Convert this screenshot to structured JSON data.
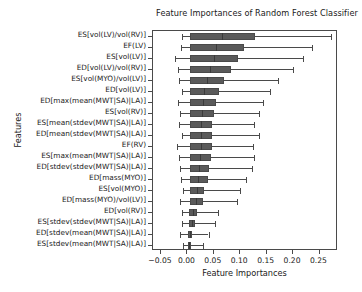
{
  "chart_data": {
    "type": "boxplot",
    "title": "Feature Importances of Random Forest Classifier",
    "xlabel": "Feature Importances",
    "ylabel": "Features",
    "orientation": "horizontal",
    "xlim": [
      -0.065,
      0.285
    ],
    "grid": false,
    "legend": null,
    "xticks": [
      -0.05,
      0.0,
      0.05,
      0.1,
      0.15,
      0.2,
      0.25
    ],
    "xticklabels": [
      "−0.05",
      "0.00",
      "0.05",
      "0.10",
      "0.15",
      "0.20",
      "0.25"
    ],
    "categories": [
      "ES[vol(LV)/vol(RV)]",
      "EF(LV)",
      "ES[vol(LV)]",
      "ED[vol(LV)/vol(RV)]",
      "ES[vol(MYO)/vol(LV)]",
      "ED[vol(LV)]",
      "ED[max(mean(MWT|SA)|LA)]",
      "ES[vol(RV)]",
      "ES[mean(stdev(MWT|SA)|LA)]",
      "ED[mean(stdev(MWT|SA)|LA)]",
      "EF(RV)",
      "ES[max(mean(MWT|SA)|LA)]",
      "ED[stdev(stdev(MWT|SA)|LA)]",
      "ED[mass(MYO)]",
      "ES[vol(MYO)]",
      "ED[mass(MYO)/vol(LV)]",
      "ED[vol(RV)]",
      "ES[stdev(stdev(MWT|SA)|LA)]",
      "ED[stdev(mean(MWT|SA)|LA)]",
      "ES[stdev(mean(MWT|SA)|LA)]"
    ],
    "boxes": [
      {
        "label": "ES[vol(LV)/vol(RV)]",
        "whislo": -0.011,
        "q1": 0.0045,
        "med": 0.065,
        "q3": 0.128,
        "whishi": 0.272
      },
      {
        "label": "EF(LV)",
        "whislo": -0.012,
        "q1": 0.0045,
        "med": 0.055,
        "q3": 0.107,
        "whishi": 0.236
      },
      {
        "label": "ES[vol(LV)]",
        "whislo": -0.024,
        "q1": 0.0045,
        "med": 0.05,
        "q3": 0.096,
        "whishi": 0.218
      },
      {
        "label": "ED[vol(LV)/vol(RV)]",
        "whislo": -0.018,
        "q1": 0.0045,
        "med": 0.043,
        "q3": 0.082,
        "whishi": 0.199
      },
      {
        "label": "ES[vol(MYO)/vol(LV)]",
        "whislo": -0.015,
        "q1": 0.0045,
        "med": 0.037,
        "q3": 0.07,
        "whishi": 0.172
      },
      {
        "label": "ED[vol(LV)]",
        "whislo": -0.01,
        "q1": 0.0045,
        "med": 0.032,
        "q3": 0.06,
        "whishi": 0.157
      },
      {
        "label": "ED[max(mean(MWT|SA)|LA)]",
        "whislo": -0.017,
        "q1": 0.0045,
        "med": 0.029,
        "q3": 0.054,
        "whishi": 0.144
      },
      {
        "label": "ES[vol(RV)]",
        "whislo": -0.013,
        "q1": 0.0045,
        "med": 0.027,
        "q3": 0.051,
        "whishi": 0.136
      },
      {
        "label": "ES[mean(stdev(MWT|SA)|LA)]",
        "whislo": -0.016,
        "q1": 0.0045,
        "med": 0.025,
        "q3": 0.047,
        "whishi": 0.126
      },
      {
        "label": "ED[mean(stdev(MWT|SA)|LA)]",
        "whislo": -0.011,
        "q1": 0.0045,
        "med": 0.025,
        "q3": 0.047,
        "whishi": 0.135
      },
      {
        "label": "EF(RV)",
        "whislo": -0.02,
        "q1": 0.0045,
        "med": 0.025,
        "q3": 0.046,
        "whishi": 0.125
      },
      {
        "label": "ES[max(mean(MWT|SA)|LA)]",
        "whislo": -0.016,
        "q1": 0.0045,
        "med": 0.024,
        "q3": 0.045,
        "whishi": 0.126
      },
      {
        "label": "ED[stdev(stdev(MWT|SA)|LA)]",
        "whislo": -0.014,
        "q1": 0.0045,
        "med": 0.022,
        "q3": 0.041,
        "whishi": 0.122
      },
      {
        "label": "ED[mass(MYO)]",
        "whislo": -0.012,
        "q1": 0.0045,
        "med": 0.021,
        "q3": 0.039,
        "whishi": 0.111
      },
      {
        "label": "ES[vol(MYO)]",
        "whislo": -0.009,
        "q1": 0.0045,
        "med": 0.018,
        "q3": 0.032,
        "whishi": 0.1
      },
      {
        "label": "ED[mass(MYO)/vol(LV)]",
        "whislo": -0.013,
        "q1": 0.0045,
        "med": 0.016,
        "q3": 0.029,
        "whishi": 0.094
      },
      {
        "label": "ED[vol(RV)]",
        "whislo": -0.011,
        "q1": 0.003,
        "med": 0.01,
        "q3": 0.018,
        "whishi": 0.058
      },
      {
        "label": "ES[stdev(stdev(MWT|SA)|LA)]",
        "whislo": -0.01,
        "q1": 0.0025,
        "med": 0.008,
        "q3": 0.014,
        "whishi": 0.053
      },
      {
        "label": "ED[stdev(mean(MWT|SA)|LA)]",
        "whislo": -0.013,
        "q1": 0.002,
        "med": 0.005,
        "q3": 0.009,
        "whishi": 0.04
      },
      {
        "label": "ES[stdev(mean(MWT|SA)|LA)]",
        "whislo": -0.009,
        "q1": 0.0015,
        "med": 0.004,
        "q3": 0.007,
        "whishi": 0.029
      }
    ],
    "colors": {
      "box_fill": "#5a5a5a",
      "box_edge": "#4a4a4a",
      "whisker": "#4a4a4a",
      "median": "#3a3a3a",
      "axes": "#4a4a4a",
      "background": "#ffffff",
      "text": "#1a1a1a"
    }
  }
}
